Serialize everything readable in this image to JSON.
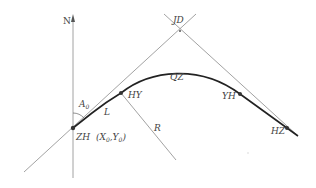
{
  "diagram": {
    "north_label": "N",
    "labels": {
      "jd": "JD",
      "qz": "QZ",
      "hy": "HY",
      "yh": "YH",
      "hz": "HZ",
      "zh": "ZH",
      "zh_coords_prefix": "(X",
      "zh_coords_sub0": "0",
      "zh_coords_mid": ",Y",
      "zh_coords_sub1": "0",
      "zh_coords_suffix": ")",
      "azimuth": "A",
      "azimuth_sub": "0",
      "spiral_length": "L",
      "radius": "R"
    },
    "colors": {
      "curve": "#222222",
      "lines": "#8a8a8a",
      "text": "#444444"
    }
  }
}
